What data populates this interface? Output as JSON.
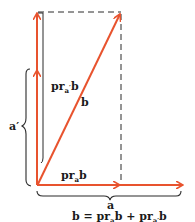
{
  "diagram": {
    "colors": {
      "vector": "#e8532e",
      "line": "#2a2a2a",
      "background": "#ffffff"
    },
    "labels": {
      "b": "b",
      "pr_a_prime_b": {
        "base": "pr",
        "sub": "a",
        "prime": "′",
        "tail": "b"
      },
      "pr_a_b": {
        "base": "pr",
        "sub": "a",
        "tail": "b"
      },
      "a_prime": "a′",
      "a": "a"
    },
    "equation": {
      "lhs": "b = ",
      "term1_base": "pr",
      "term1_sub": "a",
      "term1_tail": "b",
      "plus": " + ",
      "term2_base": "pr",
      "term2_sub": "a′",
      "term2_tail": "b"
    }
  }
}
